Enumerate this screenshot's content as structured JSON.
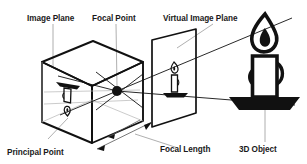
{
  "diagram": {
    "background_color": "#ffffff",
    "ink_color": "#111111",
    "leader_color": "#9a9a9a",
    "labels": {
      "image_plane": "Image Plane",
      "focal_point": "Focal Point",
      "virtual_image_plane": "Virtual Image Plane",
      "principal_point": "Principal Point",
      "focal_length": "Focal Length",
      "object_3d": "3D Object"
    },
    "elements": {
      "camera_box": "pinhole-camera-box",
      "focal_point_dot": "focal-point-dot",
      "virtual_plane": "virtual-image-plane-quad",
      "inverted_candle": "inverted-candle-image",
      "virtual_candle": "virtual-candle-image",
      "scene_candle": "scene-candle-object",
      "focal_length_arrow": "focal-length-dimension-arrow"
    }
  }
}
